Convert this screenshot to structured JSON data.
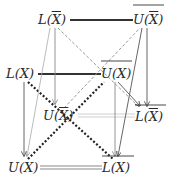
{
  "diagram": {
    "nodes": [
      {
        "id": "n1",
        "label_prefix": "L(",
        "label_var": "X",
        "label_suffix": ")",
        "var_overline": true,
        "outer_overline": false,
        "display": "L(X̄)"
      },
      {
        "id": "n2",
        "label_prefix": "U(",
        "label_var": "X",
        "label_suffix": ")",
        "var_overline": true,
        "outer_overline": true,
        "display": "overline U(X̄)"
      },
      {
        "id": "n3",
        "label_prefix": "L(",
        "label_var": "X",
        "label_suffix": ")",
        "var_overline": false,
        "outer_overline": false,
        "display": "L(X)"
      },
      {
        "id": "n4",
        "label_prefix": "U(",
        "label_var": "X",
        "label_suffix": ")",
        "var_overline": false,
        "outer_overline": true,
        "display": "overline U(X)"
      },
      {
        "id": "n5",
        "label_prefix": "U(",
        "label_var": "X",
        "label_suffix": ")",
        "var_overline": true,
        "outer_overline": false,
        "display": "U(X̄)"
      },
      {
        "id": "n6",
        "label_prefix": "L(",
        "label_var": "X",
        "label_suffix": ")",
        "var_overline": true,
        "outer_overline": true,
        "display": "overline L(X̄)"
      },
      {
        "id": "n7",
        "label_prefix": "U(",
        "label_var": "X",
        "label_suffix": ")",
        "var_overline": false,
        "outer_overline": false,
        "display": "U(X)"
      },
      {
        "id": "n8",
        "label_prefix": "L(",
        "label_var": "X",
        "label_suffix": ")",
        "var_overline": false,
        "outer_overline": true,
        "display": "overline L(X)"
      }
    ],
    "edges": [
      {
        "from": "n1",
        "to": "n2",
        "style": "thick-solid",
        "color": "#333333"
      },
      {
        "from": "n3",
        "to": "n4",
        "style": "thick-solid",
        "color": "#333333"
      },
      {
        "from": "n7",
        "to": "n8",
        "style": "double",
        "color": "#888888"
      },
      {
        "from": "n5",
        "to": "n6",
        "style": "double-light",
        "color": "#cccccc"
      },
      {
        "from": "n3",
        "to": "n8",
        "style": "thick-dotted",
        "color": "#222222"
      },
      {
        "from": "n7",
        "to": "n4",
        "style": "thick-dotted",
        "color": "#222222"
      },
      {
        "from": "n1",
        "to": "n6",
        "style": "dashed",
        "color": "#999999"
      },
      {
        "from": "n5",
        "to": "n2",
        "style": "dashed",
        "color": "#999999"
      },
      {
        "from": "n2",
        "to": "n6",
        "style": "arrow",
        "color": "#555555"
      },
      {
        "from": "n2",
        "to": "n8",
        "style": "arrow",
        "color": "#555555"
      },
      {
        "from": "n4",
        "to": "n6",
        "style": "arrow",
        "color": "#555555"
      },
      {
        "from": "n3",
        "to": "n7",
        "style": "arrow",
        "color": "#555555"
      },
      {
        "from": "n1",
        "to": "n5",
        "style": "arrow-light",
        "color": "#888888"
      },
      {
        "from": "n1",
        "to": "n7",
        "style": "arrow-light",
        "color": "#999999"
      },
      {
        "from": "n4",
        "to": "n8",
        "style": "arrow-light",
        "color": "#888888"
      }
    ]
  }
}
